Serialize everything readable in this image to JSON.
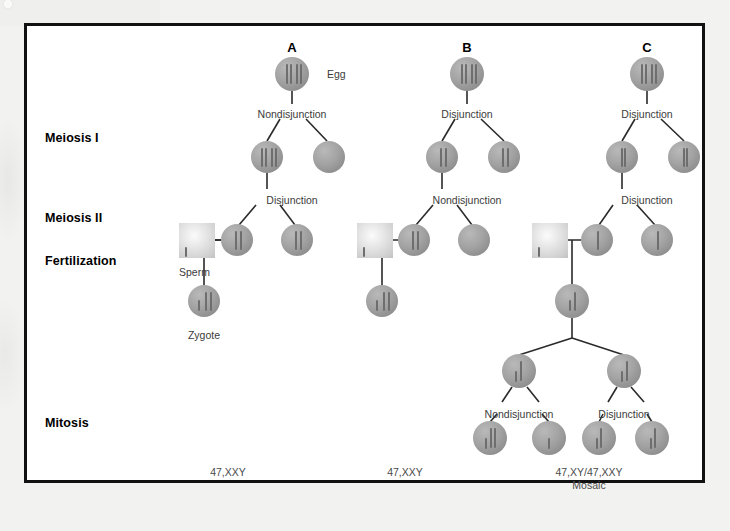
{
  "figure": {
    "row_labels": [
      {
        "text": "Meiosis I",
        "x": 18,
        "y": 105
      },
      {
        "text": "Meiosis II",
        "x": 18,
        "y": 185
      },
      {
        "text": "Fertilization",
        "x": 18,
        "y": 228
      },
      {
        "text": "Mitosis",
        "x": 18,
        "y": 390
      }
    ],
    "column_headings": [
      {
        "label": "A",
        "x": 265,
        "y": 14
      },
      {
        "label": "B",
        "x": 440,
        "y": 14
      },
      {
        "label": "C",
        "x": 620,
        "y": 14
      }
    ],
    "annotations": [
      {
        "text": "Egg",
        "x": 300,
        "y": 42,
        "align": "left"
      },
      {
        "text": "Nondisjunction",
        "x": 265,
        "y": 82,
        "align": "center"
      },
      {
        "text": "Disjunction",
        "x": 265,
        "y": 168,
        "align": "center"
      },
      {
        "text": "Sperm",
        "x": 152,
        "y": 240,
        "align": "left"
      },
      {
        "text": "Zygote",
        "x": 177,
        "y": 303,
        "align": "center"
      },
      {
        "text": "Disjunction",
        "x": 440,
        "y": 82,
        "align": "center"
      },
      {
        "text": "Nondisjunction",
        "x": 440,
        "y": 168,
        "align": "center"
      },
      {
        "text": "Disjunction",
        "x": 620,
        "y": 82,
        "align": "center"
      },
      {
        "text": "Disjunction",
        "x": 620,
        "y": 168,
        "align": "center"
      },
      {
        "text": "Nondisjunction",
        "x": 492,
        "y": 382,
        "align": "center"
      },
      {
        "text": "Disjunction",
        "x": 597,
        "y": 382,
        "align": "center"
      }
    ],
    "karyotypes": [
      {
        "line1": "47,XXY",
        "line2": "",
        "x": 201,
        "y": 440
      },
      {
        "line1": "47,XXY",
        "line2": "",
        "x": 378,
        "y": 440
      },
      {
        "line1": "47,XY/47,XXY",
        "line2": "Mosaic",
        "x": 562,
        "y": 440
      }
    ],
    "cells": [
      {
        "name": "egg-cell-a",
        "cx": 265,
        "cy": 48,
        "r": 17,
        "chromosomes": [
          {
            "dx": -6,
            "len": 20,
            "top": -10
          },
          {
            "dx": -2,
            "len": 20,
            "top": -10
          },
          {
            "dx": 4,
            "len": 20,
            "top": -10
          },
          {
            "dx": 8,
            "len": 20,
            "top": -10
          }
        ]
      },
      {
        "name": "meiosis1-a-left",
        "cx": 240,
        "cy": 131,
        "r": 16,
        "chromosomes": [
          {
            "dx": -6,
            "len": 19,
            "top": -9
          },
          {
            "dx": -2,
            "len": 19,
            "top": -9
          },
          {
            "dx": 4,
            "len": 19,
            "top": -9
          },
          {
            "dx": 8,
            "len": 19,
            "top": -9
          }
        ]
      },
      {
        "name": "meiosis1-a-right",
        "cx": 302,
        "cy": 131,
        "r": 16,
        "chromosomes": []
      },
      {
        "name": "meiosis2-a-left",
        "cx": 210,
        "cy": 214,
        "r": 16,
        "chromosomes": [
          {
            "dx": -2,
            "len": 19,
            "top": -9
          },
          {
            "dx": 3,
            "len": 19,
            "top": -9
          }
        ]
      },
      {
        "name": "meiosis2-a-right",
        "cx": 270,
        "cy": 214,
        "r": 16,
        "chromosomes": [
          {
            "dx": -2,
            "len": 19,
            "top": -9
          },
          {
            "dx": 3,
            "len": 19,
            "top": -9
          }
        ]
      },
      {
        "name": "zygote-a",
        "cx": 177,
        "cy": 275,
        "r": 16,
        "chromosomes": [
          {
            "dx": -6,
            "len": 11,
            "top": -1
          },
          {
            "dx": 1,
            "len": 19,
            "top": -9
          },
          {
            "dx": 6,
            "len": 19,
            "top": -9
          }
        ]
      },
      {
        "name": "egg-cell-b",
        "cx": 440,
        "cy": 48,
        "r": 17,
        "chromosomes": [
          {
            "dx": -6,
            "len": 20,
            "top": -10
          },
          {
            "dx": -2,
            "len": 20,
            "top": -10
          },
          {
            "dx": 4,
            "len": 20,
            "top": -10
          },
          {
            "dx": 8,
            "len": 20,
            "top": -10
          }
        ]
      },
      {
        "name": "meiosis1-b-left",
        "cx": 415,
        "cy": 131,
        "r": 16,
        "chromosomes": [
          {
            "dx": -2,
            "len": 19,
            "top": -9
          },
          {
            "dx": 3,
            "len": 19,
            "top": -9
          }
        ]
      },
      {
        "name": "meiosis1-b-right",
        "cx": 477,
        "cy": 131,
        "r": 16,
        "chromosomes": [
          {
            "dx": -2,
            "len": 19,
            "top": -9
          },
          {
            "dx": 3,
            "len": 19,
            "top": -9
          }
        ]
      },
      {
        "name": "meiosis2-b-left",
        "cx": 387,
        "cy": 214,
        "r": 16,
        "chromosomes": [
          {
            "dx": -2,
            "len": 19,
            "top": -9
          },
          {
            "dx": 3,
            "len": 19,
            "top": -9
          }
        ]
      },
      {
        "name": "meiosis2-b-right",
        "cx": 447,
        "cy": 214,
        "r": 16,
        "chromosomes": []
      },
      {
        "name": "zygote-b",
        "cx": 355,
        "cy": 275,
        "r": 16,
        "chromosomes": [
          {
            "dx": -6,
            "len": 11,
            "top": -1
          },
          {
            "dx": 1,
            "len": 19,
            "top": -9
          },
          {
            "dx": 6,
            "len": 19,
            "top": -9
          }
        ]
      },
      {
        "name": "egg-cell-c",
        "cx": 620,
        "cy": 48,
        "r": 17,
        "chromosomes": [
          {
            "dx": -6,
            "len": 20,
            "top": -10
          },
          {
            "dx": -2,
            "len": 20,
            "top": -10
          },
          {
            "dx": 4,
            "len": 20,
            "top": -10
          },
          {
            "dx": 8,
            "len": 20,
            "top": -10
          }
        ]
      },
      {
        "name": "meiosis1-c-left",
        "cx": 595,
        "cy": 131,
        "r": 16,
        "chromosomes": [
          {
            "dx": -1,
            "len": 19,
            "top": -9
          },
          {
            "dx": 2,
            "len": 19,
            "top": -9
          }
        ]
      },
      {
        "name": "meiosis1-c-right",
        "cx": 657,
        "cy": 131,
        "r": 16,
        "chromosomes": [
          {
            "dx": -1,
            "len": 19,
            "top": -9
          },
          {
            "dx": 2,
            "len": 19,
            "top": -9
          }
        ]
      },
      {
        "name": "meiosis2-c-left",
        "cx": 570,
        "cy": 214,
        "r": 16,
        "chromosomes": [
          {
            "dx": 0,
            "len": 19,
            "top": -9
          }
        ]
      },
      {
        "name": "meiosis2-c-right",
        "cx": 630,
        "cy": 214,
        "r": 16,
        "chromosomes": [
          {
            "dx": 0,
            "len": 19,
            "top": -9
          }
        ]
      },
      {
        "name": "zygote-c",
        "cx": 545,
        "cy": 275,
        "r": 17,
        "chromosomes": [
          {
            "dx": -3,
            "len": 11,
            "top": -1
          },
          {
            "dx": 2,
            "len": 19,
            "top": -9
          }
        ]
      },
      {
        "name": "mitosis-c-left",
        "cx": 492,
        "cy": 345,
        "r": 17,
        "chromosomes": [
          {
            "dx": -4,
            "len": 11,
            "top": 0
          },
          {
            "dx": 1,
            "len": 20,
            "top": -10
          }
        ]
      },
      {
        "name": "mitosis-c-right",
        "cx": 597,
        "cy": 345,
        "r": 17,
        "chromosomes": [
          {
            "dx": -3,
            "len": 11,
            "top": 0
          },
          {
            "dx": 2,
            "len": 20,
            "top": -10
          }
        ]
      },
      {
        "name": "mitosis-product-1",
        "cx": 463,
        "cy": 412,
        "r": 17,
        "chromosomes": [
          {
            "dx": -5,
            "len": 11,
            "top": 0
          },
          {
            "dx": 0,
            "len": 20,
            "top": -10
          },
          {
            "dx": 4,
            "len": 20,
            "top": -10
          }
        ]
      },
      {
        "name": "mitosis-product-2",
        "cx": 522,
        "cy": 412,
        "r": 17,
        "chromosomes": [
          {
            "dx": -1,
            "len": 11,
            "top": 0
          }
        ]
      },
      {
        "name": "mitosis-product-3",
        "cx": 572,
        "cy": 412,
        "r": 17,
        "chromosomes": [
          {
            "dx": -3,
            "len": 11,
            "top": 0
          },
          {
            "dx": 1,
            "len": 20,
            "top": -10
          }
        ]
      },
      {
        "name": "mitosis-product-4",
        "cx": 625,
        "cy": 412,
        "r": 17,
        "chromosomes": [
          {
            "dx": -2,
            "len": 11,
            "top": 0
          },
          {
            "dx": 2,
            "len": 20,
            "top": -10
          }
        ]
      }
    ],
    "sperm_cells": [
      {
        "name": "sperm-a",
        "x": 152,
        "y": 197,
        "w": 36,
        "h": 35,
        "chromosome": {
          "dx": -12,
          "len": 10,
          "top": 6
        }
      },
      {
        "name": "sperm-b",
        "x": 330,
        "y": 197,
        "w": 36,
        "h": 35,
        "chromosome": {
          "dx": -12,
          "len": 10,
          "top": 6
        }
      },
      {
        "name": "sperm-c",
        "x": 505,
        "y": 197,
        "w": 36,
        "h": 35,
        "chromosome": {
          "dx": -12,
          "len": 10,
          "top": 6
        }
      }
    ],
    "connectors": [
      {
        "x1": 265,
        "y1": 65,
        "x2": 265,
        "y2": 78
      },
      {
        "x1": 253,
        "y1": 93,
        "x2": 240,
        "y2": 115
      },
      {
        "x1": 279,
        "y1": 93,
        "x2": 300,
        "y2": 115
      },
      {
        "x1": 240,
        "y1": 147,
        "x2": 240,
        "y2": 163
      },
      {
        "x1": 229,
        "y1": 179,
        "x2": 212,
        "y2": 199
      },
      {
        "x1": 253,
        "y1": 179,
        "x2": 268,
        "y2": 199
      },
      {
        "x1": 188,
        "y1": 214,
        "x2": 194,
        "y2": 214
      },
      {
        "x1": 194,
        "y1": 214,
        "x2": 194,
        "y2": 214
      },
      {
        "x1": 177,
        "y1": 214,
        "x2": 177,
        "y2": 259
      },
      {
        "x1": 152,
        "y1": 214,
        "x2": 194,
        "y2": 214
      },
      {
        "x1": 440,
        "y1": 65,
        "x2": 440,
        "y2": 78
      },
      {
        "x1": 428,
        "y1": 93,
        "x2": 415,
        "y2": 115
      },
      {
        "x1": 454,
        "y1": 93,
        "x2": 477,
        "y2": 115
      },
      {
        "x1": 415,
        "y1": 147,
        "x2": 415,
        "y2": 163
      },
      {
        "x1": 406,
        "y1": 179,
        "x2": 389,
        "y2": 199
      },
      {
        "x1": 430,
        "y1": 179,
        "x2": 445,
        "y2": 199
      },
      {
        "x1": 330,
        "y1": 214,
        "x2": 371,
        "y2": 214
      },
      {
        "x1": 355,
        "y1": 214,
        "x2": 355,
        "y2": 259
      },
      {
        "x1": 620,
        "y1": 65,
        "x2": 620,
        "y2": 78
      },
      {
        "x1": 608,
        "y1": 93,
        "x2": 595,
        "y2": 115
      },
      {
        "x1": 634,
        "y1": 93,
        "x2": 657,
        "y2": 115
      },
      {
        "x1": 595,
        "y1": 147,
        "x2": 595,
        "y2": 163
      },
      {
        "x1": 586,
        "y1": 179,
        "x2": 572,
        "y2": 199
      },
      {
        "x1": 610,
        "y1": 179,
        "x2": 628,
        "y2": 199
      },
      {
        "x1": 505,
        "y1": 214,
        "x2": 554,
        "y2": 214
      },
      {
        "x1": 545,
        "y1": 214,
        "x2": 545,
        "y2": 258
      },
      {
        "x1": 545,
        "y1": 292,
        "x2": 545,
        "y2": 312
      },
      {
        "x1": 545,
        "y1": 312,
        "x2": 492,
        "y2": 329
      },
      {
        "x1": 545,
        "y1": 312,
        "x2": 597,
        "y2": 329
      },
      {
        "x1": 485,
        "y1": 361,
        "x2": 475,
        "y2": 376
      },
      {
        "x1": 500,
        "y1": 361,
        "x2": 512,
        "y2": 376
      },
      {
        "x1": 590,
        "y1": 361,
        "x2": 581,
        "y2": 376
      },
      {
        "x1": 604,
        "y1": 361,
        "x2": 617,
        "y2": 376
      },
      {
        "x1": 470,
        "y1": 388,
        "x2": 463,
        "y2": 396
      },
      {
        "x1": 515,
        "y1": 388,
        "x2": 522,
        "y2": 396
      },
      {
        "x1": 576,
        "y1": 388,
        "x2": 572,
        "y2": 396
      },
      {
        "x1": 620,
        "y1": 388,
        "x2": 625,
        "y2": 396
      }
    ]
  }
}
